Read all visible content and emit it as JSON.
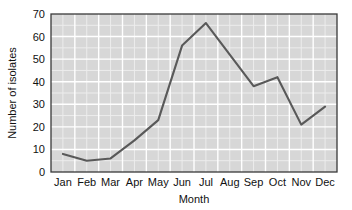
{
  "chart_data": {
    "type": "line",
    "title": "",
    "xlabel": "Month",
    "ylabel": "Number of isolates",
    "categories": [
      "Jan",
      "Feb",
      "Mar",
      "Apr",
      "May",
      "Jun",
      "Jul",
      "Aug",
      "Sep",
      "Oct",
      "Nov",
      "Dec"
    ],
    "values": [
      8,
      5,
      6,
      14,
      23,
      56,
      66,
      52,
      38,
      42,
      21,
      29
    ],
    "series": [
      {
        "name": "Number of isolates",
        "values": [
          8,
          5,
          6,
          14,
          23,
          56,
          66,
          52,
          38,
          42,
          21,
          29
        ]
      }
    ],
    "ylim": [
      0,
      70
    ],
    "ytick_labels": [
      "0",
      "10",
      "20",
      "30",
      "40",
      "50",
      "60",
      "70"
    ],
    "ytick_values": [
      0,
      10,
      20,
      30,
      40,
      50,
      60,
      70
    ],
    "xtick_labels": [
      "Jan",
      "Feb",
      "Mar",
      "Apr",
      "May",
      "Jun",
      "Jul",
      "Aug",
      "Sep",
      "Oct",
      "Nov",
      "Dec"
    ],
    "grid": true,
    "minor_grid": true,
    "legend": false,
    "legend_position": "none",
    "plot_background_color": "#d7d7d7",
    "gridline_color": "#ffffff",
    "line_color": "#595959",
    "axis_color": "#3a3a3a",
    "text_color": "#111111"
  }
}
